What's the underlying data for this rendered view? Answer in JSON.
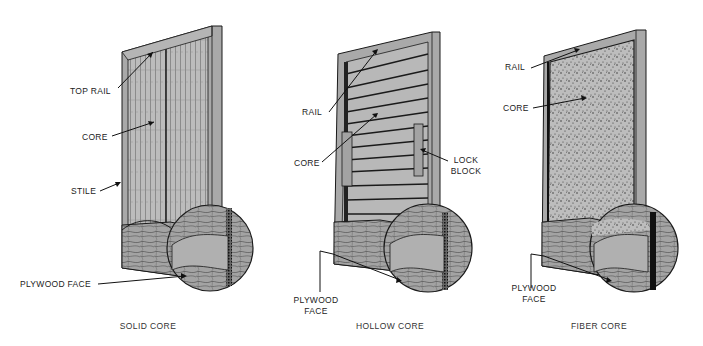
{
  "diagram": {
    "colors": {
      "background": "#ffffff",
      "frame": "#a9a9a9",
      "core": "#b9b9b9",
      "line": "#1a1a1a",
      "wood": "#9e9e9e"
    },
    "panels": [
      {
        "id": "solid",
        "caption": "SOLID CORE",
        "labels": {
          "top_rail": "TOP RAIL",
          "core": "CORE",
          "stile": "STILE",
          "plywood_face": "PLYWOOD FACE"
        }
      },
      {
        "id": "hollow",
        "caption": "HOLLOW CORE",
        "labels": {
          "rail": "RAIL",
          "core": "CORE",
          "lock_block_1": "LOCK",
          "lock_block_2": "BLOCK",
          "plywood_face_1": "PLYWOOD",
          "plywood_face_2": "FACE"
        }
      },
      {
        "id": "fiber",
        "caption": "FIBER CORE",
        "labels": {
          "rail": "RAIL",
          "core": "CORE",
          "plywood_face_1": "PLYWOOD",
          "plywood_face_2": "FACE"
        }
      }
    ]
  }
}
